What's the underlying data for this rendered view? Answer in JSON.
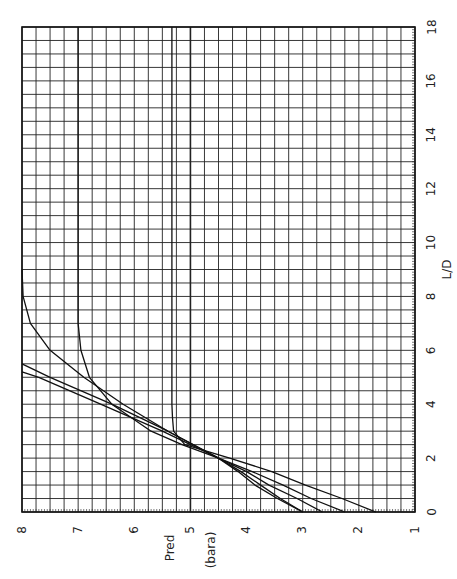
{
  "chart_data": {
    "type": "line",
    "title": "",
    "orientation_note": "figure printed rotated 90 degrees counter-clockwise",
    "xlabel": "L/D",
    "ylabel": "Pred",
    "ylabel_unit": "(bara)",
    "xlim": [
      0,
      18
    ],
    "ylim": [
      1,
      8
    ],
    "x_ticks": [
      "0",
      "2",
      "4",
      "6",
      "8",
      "10",
      "12",
      "14",
      "16",
      "18"
    ],
    "y_ticks": [
      "1",
      "2",
      "3",
      "4",
      "5",
      "6",
      "7",
      "8"
    ],
    "grid": true,
    "legend": null,
    "series": [
      {
        "name": "curve-1",
        "x": [
          0,
          0.5,
          1,
          1.5,
          2,
          2.5,
          3,
          3.5,
          4,
          4.5
        ],
        "y": [
          1.7,
          2.3,
          2.95,
          3.55,
          4.3,
          5.1,
          5.3,
          5.32,
          5.33,
          5.33
        ],
        "plateau": 5.33,
        "x_end": 18
      },
      {
        "name": "curve-2",
        "x": [
          0,
          0.5,
          1,
          1.5,
          2,
          2.5,
          3,
          4,
          5,
          6,
          7
        ],
        "y": [
          2.25,
          2.85,
          3.35,
          3.9,
          4.5,
          5.15,
          5.7,
          6.4,
          6.8,
          6.95,
          7.0
        ],
        "plateau": 7.0,
        "x_end": 18
      },
      {
        "name": "curve-3",
        "x": [
          0,
          0.5,
          1,
          1.5,
          2,
          3,
          4,
          5,
          6,
          7,
          8,
          9
        ],
        "y": [
          2.65,
          3.1,
          3.6,
          4.0,
          4.5,
          5.4,
          6.2,
          6.9,
          7.5,
          7.85,
          7.98,
          8.0
        ],
        "plateau": 8.0
      },
      {
        "name": "curve-4",
        "x": [
          0,
          0.5,
          1,
          1.5,
          2,
          3,
          4,
          5,
          5.5
        ],
        "y": [
          3.0,
          3.4,
          3.75,
          4.1,
          4.5,
          5.4,
          6.4,
          7.5,
          8.0
        ]
      },
      {
        "name": "curve-5",
        "x": [
          0,
          0.5,
          1,
          1.5,
          2,
          3,
          4,
          5,
          5.2
        ],
        "y": [
          3.0,
          3.45,
          3.85,
          4.15,
          4.5,
          5.5,
          6.6,
          7.7,
          8.0
        ]
      }
    ]
  }
}
